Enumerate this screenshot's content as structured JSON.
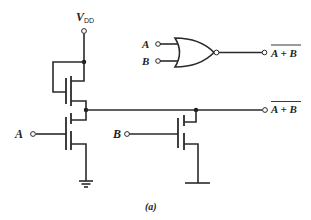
{
  "diagram": {
    "caption": "(a)",
    "supply": {
      "label": "V",
      "subscript": "DD"
    },
    "inputs": [
      {
        "id": "A",
        "label": "A"
      },
      {
        "id": "B",
        "label": "B"
      }
    ],
    "output": {
      "label": "A + B",
      "overbar": true
    },
    "logic_symbol": {
      "type": "NOR",
      "inputs": [
        "A",
        "B"
      ],
      "output": {
        "label": "A + B",
        "overbar": true
      }
    },
    "components": [
      {
        "name": "load-transistor",
        "type": "depletion NMOS",
        "gate_tied_to": "source/output"
      },
      {
        "name": "driver-transistor-a",
        "type": "enhancement NMOS",
        "gate": "A"
      },
      {
        "name": "driver-transistor-b",
        "type": "enhancement NMOS",
        "gate": "B"
      }
    ],
    "ground_symbol": "ground"
  }
}
